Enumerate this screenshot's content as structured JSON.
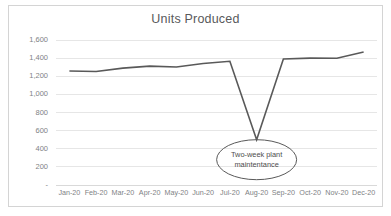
{
  "chart_data": {
    "type": "line",
    "title": "Units Produced",
    "xlabel": "",
    "ylabel": "",
    "categories": [
      "Jan-20",
      "Feb-20",
      "Mar-20",
      "Apr-20",
      "May-20",
      "Jun-20",
      "Jul-20",
      "Aug-20",
      "Sep-20",
      "Oct-20",
      "Nov-20",
      "Dec-20"
    ],
    "values": [
      1258,
      1252,
      1290,
      1312,
      1302,
      1340,
      1365,
      500,
      1390,
      1400,
      1398,
      1468
    ],
    "ylim": [
      0,
      1600
    ],
    "ytick_values": [
      0,
      200,
      400,
      600,
      800,
      1000,
      1200,
      1400,
      1600
    ],
    "ytick_labels": [
      "-",
      "200",
      "400",
      "600",
      "800",
      "1,000",
      "1,200",
      "1,400",
      "1,600"
    ],
    "grid": true,
    "legend": false,
    "series_color": "#595959",
    "grid_color": "#e6e6e6",
    "axis_color": "#d9d9d9",
    "annotations": [
      {
        "text": "Two-week plant maintentance",
        "line1": "Two-week plant",
        "line2": "maintentance",
        "shape": "ellipse",
        "target_category": "Aug-20",
        "target_value": 500
      }
    ]
  },
  "card": {
    "border_color": "#d4d4d4",
    "background": "#ffffff"
  }
}
